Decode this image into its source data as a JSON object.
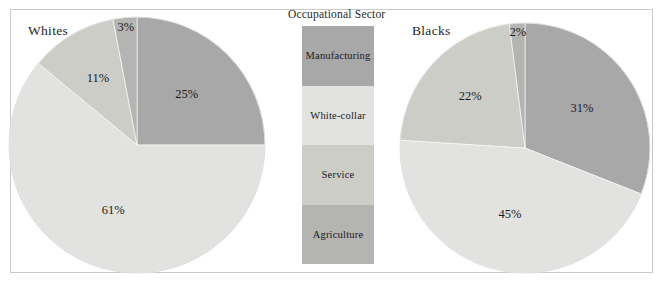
{
  "figure": {
    "width": 665,
    "height": 285,
    "background": "#ffffff",
    "border_color": "#c9c9c9"
  },
  "legend": {
    "title": "Occupational Sector",
    "items": [
      {
        "label": "Manufacturing",
        "color": "#a8a8a8"
      },
      {
        "label": "White-collar",
        "color": "#e2e2e0"
      },
      {
        "label": "Service",
        "color": "#cdcdc8"
      },
      {
        "label": "Agriculture",
        "color": "#b4b4b2"
      }
    ]
  },
  "panels": [
    {
      "id": "whites",
      "title": "Whites"
    },
    {
      "id": "blacks",
      "title": "Blacks"
    }
  ],
  "chart_data": {
    "type": "pie",
    "title": "Occupational Sector",
    "legend_position": "center",
    "categories": [
      "Manufacturing",
      "White-collar",
      "Service",
      "Agriculture"
    ],
    "colors": [
      "#a8a8a8",
      "#e2e2e0",
      "#cdcdc8",
      "#b4b4b2"
    ],
    "charts": [
      {
        "name": "Whites",
        "values": [
          25,
          61,
          11,
          3
        ],
        "labels": [
          "25%",
          "61%",
          "11%",
          "3%"
        ],
        "center": [
          137,
          145
        ],
        "radius": 128,
        "start_angle_deg": 0,
        "direction": "clockwise"
      },
      {
        "name": "Blacks",
        "values": [
          31,
          45,
          22,
          2
        ],
        "labels": [
          "31%",
          "45%",
          "22%",
          "2%"
        ],
        "center": [
          525,
          148
        ],
        "radius": 125,
        "start_angle_deg": 0,
        "direction": "clockwise"
      }
    ]
  }
}
